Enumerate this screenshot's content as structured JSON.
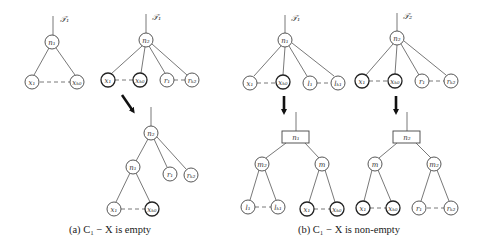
{
  "figure": {
    "panel_a": {
      "caption": "(a) C₁ − X is empty",
      "tree_T1": {
        "label": "T₁",
        "root": "n₁",
        "leaves": [
          "x₁",
          "xₖ₀"
        ]
      },
      "tree_T2": {
        "label": "T₂",
        "root": "n₂",
        "leaves": [
          "x₁",
          "xₖ₀",
          "r₁",
          "rₖ₂"
        ]
      },
      "result_tree": {
        "root": "n₂",
        "inner": "n₁",
        "children_of_root": [
          "n₁",
          "r₁",
          "rₖ₂"
        ],
        "children_of_inner": [
          "x₁",
          "xₖ₀"
        ]
      }
    },
    "panel_b": {
      "caption": "(b) C₁ − X is non-empty",
      "tree_T1": {
        "label": "T₁",
        "root": "n₁",
        "leaves": [
          "x₁",
          "xₖ₀",
          "l₁",
          "lₖ₁"
        ]
      },
      "tree_T2": {
        "label": "T₂",
        "root": "n₂",
        "leaves": [
          "x₁",
          "xₖ₀",
          "r₁",
          "rₖ₂"
        ]
      },
      "result_T1": {
        "root": "n₁",
        "children": [
          "m₂",
          "m"
        ],
        "m2_leaves": [
          "l₁",
          "lₖ₁"
        ],
        "m_leaves": [
          "x₁",
          "xₖ₀"
        ]
      },
      "result_T2": {
        "root": "n₂",
        "children": [
          "m",
          "m₂"
        ],
        "m_leaves": [
          "x₁",
          "xₖ₀"
        ],
        "m2_leaves": [
          "r₁",
          "rₖ₂"
        ]
      }
    },
    "labels": {
      "T1": "𝒯₁",
      "T2": "𝒯₂",
      "n1": "n₁",
      "n2": "n₂",
      "m": "m",
      "m2": "m₂",
      "x1": "x₁",
      "xk": "xₖ₀",
      "r1": "r₁",
      "rk": "rₖ₂",
      "l1": "l₁",
      "lk": "lₖ₁"
    }
  }
}
